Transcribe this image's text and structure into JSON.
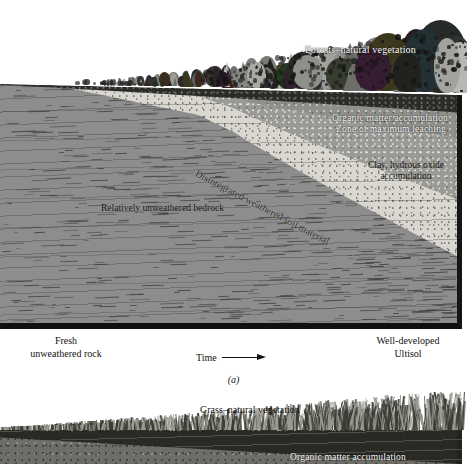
{
  "figure": {
    "panels": [
      {
        "id": "a",
        "caption": "(a)",
        "labels": {
          "vegetation": "Forests–natural vegetation",
          "organic_matter": "Organic matter accumulation",
          "leaching": "Zone of maximum leaching",
          "clay": "Clay, hydrous oxide accumulation",
          "disintegrated": "Disintegrated weathered soil material",
          "bedrock": "Relatively unweathered bedrock",
          "left_state": "Fresh\nunweathered rock",
          "left_state_line1": "Fresh",
          "left_state_line2": "unweathered rock",
          "right_state_line1": "Well-developed",
          "right_state_line2": "Ultisol",
          "time_axis": "Time",
          "time_arrow": "→"
        }
      },
      {
        "id": "b",
        "labels": {
          "vegetation": "Grass–natural vegetation",
          "organic_matter": "Organic matter accumulation"
        }
      }
    ]
  },
  "colors": {
    "bedrock_gray": "#8d8d8d",
    "disintegrated_light": "#d9d7cf",
    "clay_gray": "#9a9a96",
    "leach_gray": "#8f8f8b",
    "organic_dark": "#2b2b28",
    "border_black": "#151515",
    "label_white": "#ffffff",
    "label_black": "#15130f",
    "soil_b": "#6e6d68",
    "paper": "#ffffff"
  },
  "chart_data": {
    "type": "diagram",
    "xlabel": "Time",
    "horizons_panel_a": [
      {
        "name": "Organic matter accumulation",
        "order": 1,
        "thickness_trend": "thickens to the right"
      },
      {
        "name": "Zone of maximum leaching",
        "order": 2,
        "thickness_trend": "thickens to the right"
      },
      {
        "name": "Clay, hydrous oxide accumulation",
        "order": 3,
        "thickness_trend": "thickens to the right"
      },
      {
        "name": "Disintegrated weathered soil material",
        "order": 4,
        "thickness_trend": "wedge widening to the right"
      },
      {
        "name": "Relatively unweathered bedrock",
        "order": 5,
        "thickness_trend": "thins to the right"
      }
    ],
    "endpoints": {
      "left": "Fresh unweathered rock",
      "right": "Well-developed Ultisol"
    }
  }
}
